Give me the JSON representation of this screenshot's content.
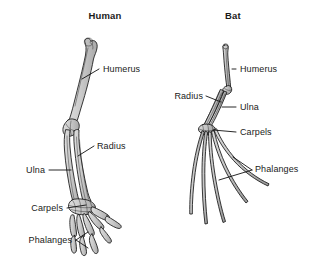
{
  "figure": {
    "kind": "comparative-anatomy-diagram",
    "background_color": "#ffffff",
    "bone_fill_color": "#c9c9c9",
    "bone_outline_color": "#171717",
    "label_color": "#1a1a1a"
  },
  "panels": [
    {
      "id": "human",
      "title": "Human",
      "title_x": 105,
      "title_y": 19,
      "labels": [
        {
          "name": "humerus",
          "text": "Humerus",
          "x": 103,
          "y": 72,
          "align": "right"
        },
        {
          "name": "radius",
          "text": "Radius",
          "x": 97,
          "y": 149,
          "align": "right"
        },
        {
          "name": "ulna",
          "text": "Ulna",
          "x": 45,
          "y": 173,
          "align": "end"
        },
        {
          "name": "carpels",
          "text": "Carpels",
          "x": 63,
          "y": 211,
          "align": "end"
        },
        {
          "name": "phalanges",
          "text": "Phalanges",
          "x": 72,
          "y": 243,
          "align": "end"
        }
      ]
    },
    {
      "id": "bat",
      "title": "Bat",
      "title_x": 233,
      "title_y": 19,
      "labels": [
        {
          "name": "humerus",
          "text": "Humerus",
          "x": 240,
          "y": 72,
          "align": "right"
        },
        {
          "name": "radius",
          "text": "Radius",
          "x": 203,
          "y": 99,
          "align": "end"
        },
        {
          "name": "ulna",
          "text": "Ulna",
          "x": 240,
          "y": 110,
          "align": "right"
        },
        {
          "name": "carpels",
          "text": "Carpels",
          "x": 240,
          "y": 135,
          "align": "right"
        },
        {
          "name": "phalanges",
          "text": "Phalanges",
          "x": 255,
          "y": 172,
          "align": "right"
        }
      ]
    }
  ],
  "bone_names": [
    "Humerus",
    "Radius",
    "Ulna",
    "Carpels",
    "Phalanges"
  ]
}
